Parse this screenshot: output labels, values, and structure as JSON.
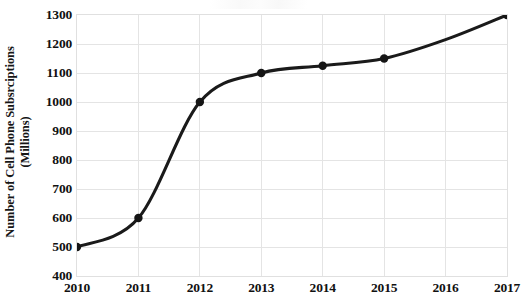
{
  "chart_data": {
    "type": "line",
    "title": "",
    "xlabel": "",
    "ylabel": "Number of Cell Phone Subsrciptions (Millions)",
    "ylabel_line1": "Number of Cell Phone Subsrciptions",
    "ylabel_line2": "(Millions)",
    "categories": [
      "2010",
      "2011",
      "2012",
      "2013",
      "2014",
      "2015",
      "2016",
      "2017"
    ],
    "x": [
      2010,
      2011,
      2012,
      2013,
      2014,
      2015,
      2016,
      2017
    ],
    "values": [
      500,
      600,
      1000,
      1100,
      1125,
      1150,
      1215,
      1300
    ],
    "marker_shown": [
      true,
      true,
      true,
      true,
      true,
      true,
      false,
      true
    ],
    "series": [
      {
        "name": "Cell Phone Subscriptions",
        "values": [
          500,
          600,
          1000,
          1100,
          1125,
          1150,
          1215,
          1300
        ],
        "color": "#1a1a1a"
      }
    ],
    "ylim": [
      400,
      1300
    ],
    "xlim": [
      2010,
      2017
    ],
    "ytick_labels": [
      "1300",
      "1200",
      "1100",
      "1000",
      "900",
      "800",
      "700",
      "600",
      "500",
      "400"
    ],
    "ytick_values": [
      1300,
      1200,
      1100,
      1000,
      900,
      800,
      700,
      600,
      500,
      400
    ],
    "ytick_step": 100,
    "xtick_labels": [
      "2010",
      "2011",
      "2012",
      "2013",
      "2014",
      "2015",
      "2016",
      "2017"
    ],
    "grid": true,
    "grid_color": "#e4e4e4",
    "legend": false,
    "legend_position": "none",
    "line_color": "#1a1a1a",
    "marker_color": "#151515",
    "background_color": "#ffffff",
    "annotations": []
  }
}
